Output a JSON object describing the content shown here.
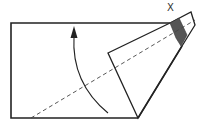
{
  "diagram": {
    "type": "folding-instruction",
    "labels": {
      "corner_marker": "X"
    },
    "colors": {
      "line": "#222222",
      "fill_paper": "#ffffff",
      "fill_shaded": "#555555",
      "dashed_line": "#444444"
    },
    "elements": {
      "paper_rectangle": "Rectangle sheet with right portion folded",
      "fold_flap": "Folded triangular flap extending to upper right",
      "shaded_region": "Dark shaded band near corner X",
      "fold_line": "Dashed diagonal fold line",
      "fold_arrow": "Curved arrow indicating upward fold direction"
    }
  }
}
